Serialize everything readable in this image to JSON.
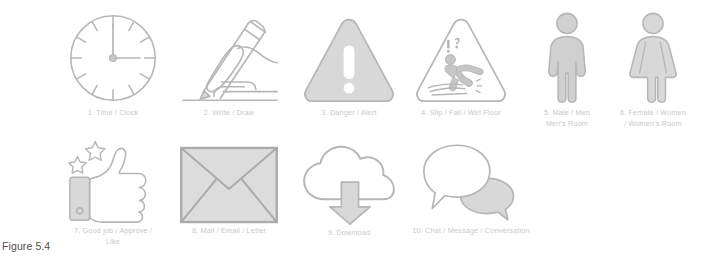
{
  "figure": {
    "caption": "Figure 5.4",
    "background_color": "#ffffff",
    "label_color": "#c8c8c8",
    "icon_stroke_color": "#b6b6b6",
    "icon_fill_color": "#d8d8d8"
  },
  "icons": [
    {
      "number": "1",
      "name": "clock-icon",
      "label": "1. Time / Clock",
      "description": "analog clock face with twelve tick marks and hands at twelve and three"
    },
    {
      "number": "2",
      "name": "write-draw-icon",
      "label": "2. Write / Draw",
      "description": "hand holding a pencil drawing a line"
    },
    {
      "number": "3",
      "name": "danger-alert-icon",
      "label": "3. Danger / Alert",
      "description": "filled warning triangle with exclamation mark"
    },
    {
      "number": "4",
      "name": "slip-fall-wet-floor-icon",
      "label": "4. Slip / Fall / Wet Floor",
      "description": "outlined triangle with falling person and exclamation question marks"
    },
    {
      "number": "5",
      "name": "male-restroom-icon",
      "label": "5. Male / Men\nMen's Room",
      "description": "standing male pictogram figure"
    },
    {
      "number": "6",
      "name": "female-restroom-icon",
      "label": "6. Female / Women\n/ Women's Room",
      "description": "standing female pictogram figure wearing a dress"
    },
    {
      "number": "7",
      "name": "thumbs-up-icon",
      "label": "7. Good job / Approve /\nLike",
      "description": "thumbs up hand with two stars and a wrist cuff"
    },
    {
      "number": "8",
      "name": "mail-envelope-icon",
      "label": "8. Mail / Email / Letter",
      "description": "closed envelope with crossed flap lines"
    },
    {
      "number": "9",
      "name": "download-cloud-icon",
      "label": "9. Download",
      "description": "cloud outline with downward arrow"
    },
    {
      "number": "10",
      "name": "chat-message-icon",
      "label": "10. Chat / Message / Conversation",
      "description": "two overlapping speech bubbles"
    }
  ]
}
